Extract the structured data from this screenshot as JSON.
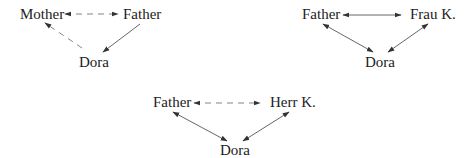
{
  "colors": {
    "text": "#222222",
    "edge": "#555555",
    "dashed_edge": "#777777",
    "background": "#ffffff"
  },
  "diagrams": [
    {
      "id": "triangle-1",
      "nodes": {
        "left": "Mother",
        "right": "Father",
        "bottom": "Dora"
      },
      "edges": [
        {
          "from": "Mother",
          "to": "Father",
          "style": "dashed",
          "arrows": "both"
        },
        {
          "from": "Dora",
          "to": "Mother",
          "style": "dashed",
          "arrows": "end"
        },
        {
          "from": "Father",
          "to": "Dora",
          "style": "solid",
          "arrows": "end"
        }
      ]
    },
    {
      "id": "triangle-2",
      "nodes": {
        "left": "Father",
        "right": "Frau K.",
        "bottom": "Dora"
      },
      "edges": [
        {
          "from": "Father",
          "to": "Frau K.",
          "style": "solid",
          "arrows": "both"
        },
        {
          "from": "Father",
          "to": "Dora",
          "style": "solid",
          "arrows": "both"
        },
        {
          "from": "Frau K.",
          "to": "Dora",
          "style": "solid",
          "arrows": "both"
        }
      ]
    },
    {
      "id": "triangle-3",
      "nodes": {
        "left": "Father",
        "right": "Herr K.",
        "bottom": "Dora"
      },
      "edges": [
        {
          "from": "Father",
          "to": "Herr K.",
          "style": "dashed",
          "arrows": "both"
        },
        {
          "from": "Father",
          "to": "Dora",
          "style": "solid",
          "arrows": "both"
        },
        {
          "from": "Herr K.",
          "to": "Dora",
          "style": "solid",
          "arrows": "both"
        }
      ]
    }
  ]
}
